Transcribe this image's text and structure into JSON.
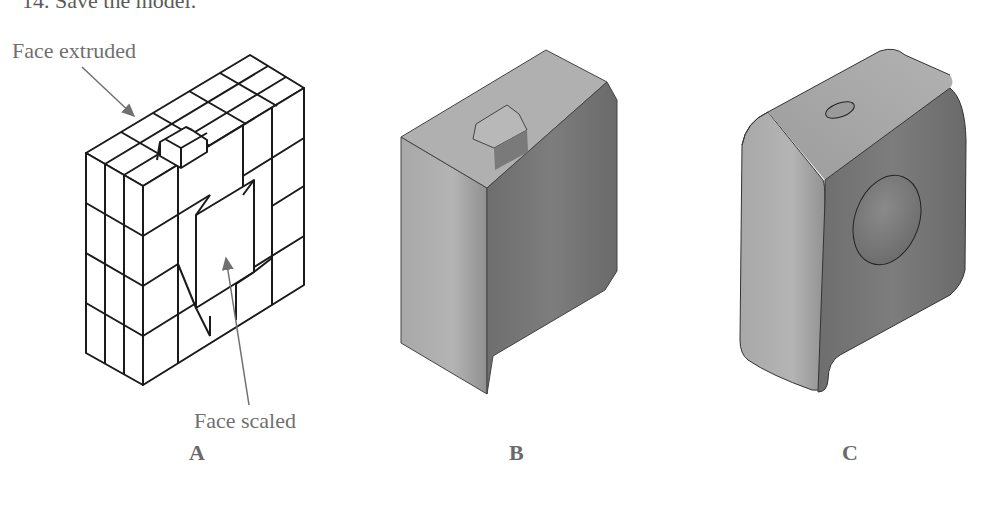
{
  "page": {
    "cut_off_step_text": "14. Save the model."
  },
  "figures": [
    {
      "id": "A",
      "caption": "A",
      "description": "Wireframe subdivision cage of a box with one top face extruded and front face scaled",
      "callouts": [
        {
          "label": "Face extruded"
        },
        {
          "label": "Face scaled"
        }
      ]
    },
    {
      "id": "B",
      "caption": "B",
      "description": "Shaded polygonal model with chamfered corners and small top extrusion"
    },
    {
      "id": "C",
      "caption": "C",
      "description": "Smoothed subdivision surface model with rounded edges, top nub and circular recess"
    }
  ],
  "colors": {
    "line": "#1a1a1a",
    "callout_arrow": "#707070",
    "shade_light": "#b8b8b8",
    "shade_mid": "#9a9a9a",
    "shade_dark": "#6e6e6e"
  }
}
